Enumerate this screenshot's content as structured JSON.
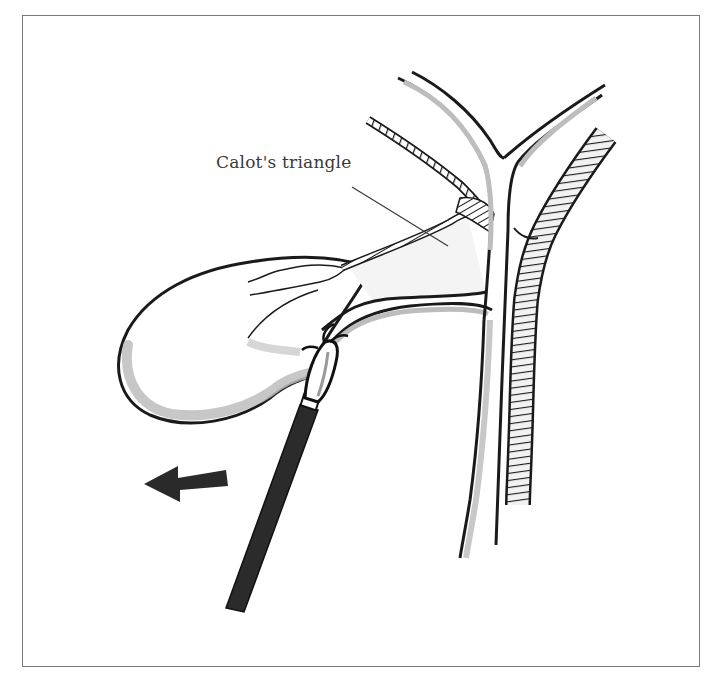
{
  "figure": {
    "labels": [
      {
        "id": "calots-triangle",
        "text": "Calot's triangle"
      }
    ],
    "elements": [
      "gallbladder",
      "cystic-duct",
      "cystic-artery",
      "common-hepatic-duct",
      "right-hepatic-duct",
      "left-hepatic-duct",
      "common-bile-duct",
      "hepatic-artery",
      "grasper-instrument",
      "traction-arrow"
    ],
    "arrow_direction": "left",
    "colors": {
      "ink": "#1a1a1a",
      "shade": "#b8b8b8",
      "frame": "#7a7a7a",
      "background": "#ffffff"
    }
  }
}
